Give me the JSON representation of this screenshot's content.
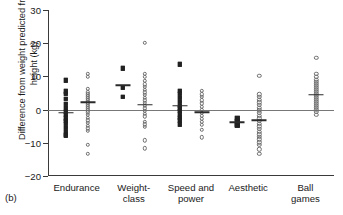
{
  "figure": {
    "panel_label": "(b)",
    "ylabel": "Difference from weight predicted from height (kg)"
  },
  "chart_data": {
    "type": "scatter",
    "title": "",
    "xlabel": "",
    "ylabel": "Difference from weight predicted from height (kg)",
    "ylim": [
      -20,
      30
    ],
    "yticks": [
      -20,
      -10,
      0,
      10,
      20,
      30
    ],
    "ytick_labels": [
      "−20",
      "−10",
      "0",
      "10",
      "20",
      "30"
    ],
    "grid": false,
    "legend": "none",
    "reference_line": 0,
    "categories": [
      "Endurance",
      "Weight-class",
      "Speed and power",
      "Aesthetic",
      "Ball games"
    ],
    "category_labels": [
      "Endurance",
      "Weight-\nclass",
      "Speed and\npower",
      "Aesthetic",
      "Ball games"
    ],
    "series": [
      {
        "name": "Male",
        "marker": "filled-square",
        "groups": [
          {
            "category": "Endurance",
            "mean": -1.0,
            "values": [
              8.8,
              5.5,
              4.8,
              3.2,
              1.8,
              0.4,
              -0.6,
              -1.6,
              -2.6,
              -3.4,
              -4.2,
              -5.4,
              -6.6,
              -7.6,
              -7.9
            ]
          },
          {
            "category": "Weight-class",
            "mean": 7.4,
            "values": [
              12.4,
              6.6,
              3.8
            ]
          },
          {
            "category": "Speed and power",
            "mean": 1.1,
            "values": [
              13.7,
              5.6,
              4.8,
              3.6,
              2.4,
              1.2,
              0.4,
              -0.4,
              -1.4,
              -2.4,
              -3.2,
              -4.4
            ]
          },
          {
            "category": "Aesthetic",
            "mean": -3.8,
            "values": [
              -2.6,
              -3.5,
              -4.4,
              -4.8
            ]
          },
          {
            "category": "Ball games",
            "mean": null,
            "values": []
          }
        ]
      },
      {
        "name": "Female",
        "marker": "open-circle",
        "groups": [
          {
            "category": "Endurance",
            "mean": 2.2,
            "values": [
              10.8,
              9.9,
              6.2,
              5.2,
              4.6,
              4.0,
              3.4,
              2.8,
              2.2,
              1.6,
              1.0,
              0.4,
              -0.2,
              -0.8,
              -1.6,
              -2.4,
              -3.2,
              -4.0,
              -4.8,
              -5.6,
              -6.4,
              -10.6,
              -13.3
            ]
          },
          {
            "category": "Weight-class",
            "mean": 1.5,
            "values": [
              20.1,
              10.8,
              9.8,
              8.6,
              7.6,
              6.8,
              6.0,
              5.2,
              4.4,
              3.6,
              2.8,
              2.0,
              1.2,
              0.4,
              -0.4,
              -1.2,
              -2.0,
              -3.6,
              -4.4,
              -5.2,
              -9.2,
              -11.6
            ]
          },
          {
            "category": "Speed and power",
            "mean": -0.8,
            "values": [
              5.6,
              4.6,
              3.8,
              2.8,
              1.9,
              0.9,
              0.0,
              -0.9,
              -1.8,
              -2.7,
              -3.6,
              -4.6,
              -6.1,
              -8.3
            ]
          },
          {
            "category": "Aesthetic",
            "mean": -3.2,
            "values": [
              10.2,
              4.6,
              3.8,
              3.0,
              2.2,
              1.4,
              0.6,
              -0.2,
              -1.0,
              -1.8,
              -2.6,
              -3.4,
              -4.2,
              -5.0,
              -5.8,
              -6.6,
              -7.4,
              -8.2,
              -9.0,
              -9.8,
              -10.6,
              -12.0,
              -13.4
            ]
          },
          {
            "category": "Ball games",
            "mean": 4.5,
            "values": [
              15.6,
              10.8,
              9.8,
              9.0,
              8.4,
              7.8,
              7.2,
              6.6,
              6.0,
              5.4,
              4.8,
              4.2,
              3.6,
              3.0,
              2.4,
              1.8,
              1.2,
              0.6,
              0.0,
              -0.7,
              -1.6
            ]
          }
        ]
      }
    ]
  }
}
